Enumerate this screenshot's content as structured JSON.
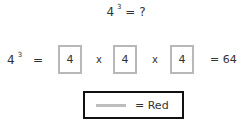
{
  "question": {
    "base": "4",
    "exponent": "3",
    "rest": "= ?"
  },
  "expansion": {
    "base": "4",
    "exponent": "3",
    "equals": "=",
    "boxes": [
      "4",
      "4",
      "4"
    ],
    "operators": [
      "x",
      "x"
    ],
    "result": "= 64"
  },
  "legend": {
    "swatch_color": "#bdbdbd",
    "label": "= Red"
  }
}
